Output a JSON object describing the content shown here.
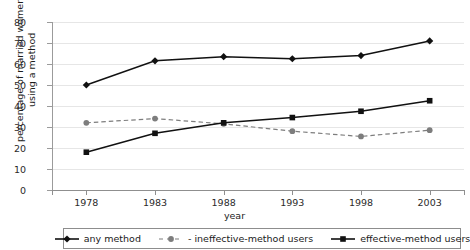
{
  "chart_data": {
    "type": "line",
    "title": "",
    "xlabel": "year",
    "ylabel": "percentage of married women using a method",
    "ylabel_line1": "percentage of married women",
    "ylabel_line2": "using a method",
    "categories": [
      "1978",
      "1983",
      "1988",
      "1993",
      "1998",
      "2003"
    ],
    "x": [
      1978,
      1983,
      1988,
      1993,
      1998,
      2003
    ],
    "ylim": [
      0,
      80
    ],
    "yticks": [
      "80",
      "70",
      "60",
      "50",
      "40",
      "30",
      "20",
      "10",
      "0"
    ],
    "ytick_values": [
      80,
      70,
      60,
      50,
      40,
      30,
      20,
      10,
      0
    ],
    "grid": "horizontal",
    "legend_position": "bottom",
    "series": [
      {
        "name": "any method",
        "values": [
          50,
          61.5,
          63.5,
          62.5,
          64,
          71
        ],
        "color": "#111111",
        "marker": "diamond",
        "linestyle": "solid"
      },
      {
        "name": "- ineffective-method users",
        "values": [
          32,
          34,
          31.5,
          28,
          25.5,
          28.5
        ],
        "color": "#7d7d7d",
        "marker": "circle",
        "linestyle": "dashed"
      },
      {
        "name": "effective-method users",
        "values": [
          18,
          27,
          32,
          34.5,
          37.5,
          42.5
        ],
        "color": "#111111",
        "marker": "square",
        "linestyle": "solid"
      }
    ]
  },
  "legend": {
    "items": [
      {
        "label": "any method",
        "marker": "diamond-line-marker"
      },
      {
        "label": "- ineffective-method users",
        "marker": "circle-dashed-marker"
      },
      {
        "label": "effective-method users",
        "marker": "square-line-marker"
      }
    ]
  },
  "title_strip": {
    "text": ""
  },
  "colors": {
    "gridline": "#e6e6e6",
    "axis": "#8f8f8f",
    "series_dark": "#111111",
    "series_gray": "#7d7d7d",
    "background": "#ffffff"
  }
}
